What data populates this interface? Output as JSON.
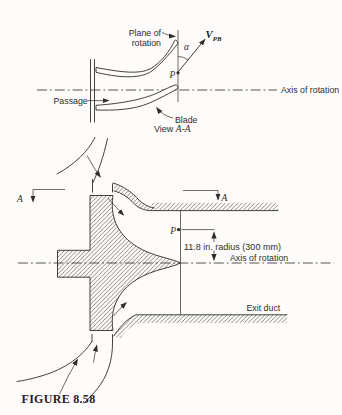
{
  "figure": {
    "caption": "FIGURE 8.58",
    "ink_color": "#2f2c29",
    "caption_color": "#32181c",
    "background_color": "#fdfcfa"
  },
  "top_view": {
    "plane_label_line1": "Plane of",
    "plane_label_line2": "rotation",
    "velocity_symbol": "V",
    "velocity_subscript": "PB",
    "angle_symbol": "α",
    "point_label": "P",
    "axis_label": "Axis of rotation",
    "passage_label": "Passage",
    "blade_label": "Blade",
    "view_prefix": "View ",
    "view_section": "A-A"
  },
  "section_view": {
    "section_letter_left": "A",
    "section_letter_right": "A",
    "point_label": "P",
    "radius_dimension": "11.8 in. radius (300 mm)",
    "axis_label": "Axis of rotation",
    "exit_duct_label": "Exit duct"
  }
}
